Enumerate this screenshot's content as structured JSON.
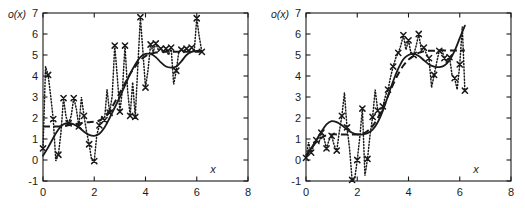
{
  "figure": {
    "panel_count": 2,
    "background": "#ffffff",
    "ink": "#1a1a1a"
  },
  "axes": {
    "ylabel": "o(x)",
    "xlabel": "x",
    "xticks": [
      "0",
      "2",
      "4",
      "6",
      "8"
    ],
    "xtick_values": [
      0,
      2,
      4,
      6,
      8
    ],
    "yticks": [
      "7",
      "6",
      "5",
      "4",
      "3",
      "2",
      "1",
      "0",
      "-1"
    ],
    "ytick_values": [
      7,
      6,
      5,
      4,
      3,
      2,
      1,
      0,
      -1
    ],
    "xlim": [
      0,
      8
    ],
    "ylim": [
      -1,
      7
    ],
    "grid": false,
    "box": true
  },
  "chart_data": [
    {
      "type": "line",
      "title": "",
      "panel": "left",
      "xlabel": "x",
      "ylabel": "o(x)",
      "xlim": [
        0,
        8
      ],
      "ylim": [
        -1,
        7
      ],
      "grid": false,
      "legend_position": "none",
      "series": [
        {
          "name": "noisy-samples",
          "style": "dotted-with-x-markers",
          "marker": "x",
          "x": [
            0.0,
            0.1,
            0.2,
            0.3,
            0.4,
            0.5,
            0.6,
            0.7,
            0.8,
            0.9,
            1.0,
            1.1,
            1.2,
            1.3,
            1.4,
            1.5,
            1.6,
            1.7,
            1.8,
            1.9,
            2.0,
            2.1,
            2.2,
            2.3,
            2.4,
            2.5,
            2.6,
            2.7,
            2.8,
            2.9,
            3.0,
            3.1,
            3.2,
            3.3,
            3.4,
            3.5,
            3.6,
            3.7,
            3.8,
            3.9,
            4.0,
            4.1,
            4.2,
            4.3,
            4.4,
            4.5,
            4.6,
            4.7,
            4.8,
            4.9,
            5.0,
            5.1,
            5.2,
            5.3,
            5.4,
            5.5,
            5.6,
            5.7,
            5.8,
            5.9,
            6.0,
            6.1,
            6.2
          ],
          "y": [
            0.55,
            4.45,
            4.05,
            3.05,
            1.95,
            -0.05,
            0.25,
            1.3,
            2.95,
            2.05,
            1.75,
            2.1,
            2.95,
            2.45,
            1.6,
            3.0,
            2.1,
            1.35,
            0.75,
            0.0,
            -0.05,
            1.2,
            1.65,
            2.1,
            1.9,
            3.35,
            2.25,
            3.05,
            5.45,
            3.95,
            2.3,
            3.35,
            5.45,
            3.35,
            2.1,
            3.7,
            2.05,
            4.45,
            6.8,
            5.15,
            3.45,
            4.3,
            5.5,
            5.15,
            5.55,
            5.25,
            5.3,
            5.1,
            5.3,
            5.0,
            5.35,
            3.6,
            4.25,
            5.15,
            5.25,
            5.2,
            5.3,
            5.2,
            5.35,
            5.15,
            6.75,
            5.85,
            5.15
          ]
        },
        {
          "name": "solid-fit",
          "style": "solid",
          "x": [
            0.0,
            0.2,
            0.4,
            0.6,
            0.8,
            1.0,
            1.2,
            1.4,
            1.6,
            1.8,
            2.0,
            2.2,
            2.4,
            2.6,
            2.8,
            3.0,
            3.2,
            3.4,
            3.6,
            3.8,
            4.0,
            4.2,
            4.4,
            4.6,
            4.8,
            5.0,
            5.2,
            5.4,
            5.6,
            5.8,
            6.0,
            6.2
          ],
          "y": [
            0.2,
            0.6,
            1.05,
            1.45,
            1.7,
            1.75,
            1.7,
            1.55,
            1.35,
            1.2,
            1.15,
            1.25,
            1.55,
            2.0,
            2.5,
            3.0,
            3.55,
            4.1,
            4.55,
            4.9,
            5.05,
            5.05,
            4.9,
            4.65,
            4.45,
            4.4,
            4.45,
            4.7,
            5.0,
            5.15,
            5.2,
            5.2
          ]
        },
        {
          "name": "dashed-fit",
          "style": "dashed",
          "x": [
            0.0,
            0.2,
            0.4,
            0.6,
            0.8,
            1.0,
            1.2,
            1.4,
            1.6,
            1.8,
            2.0,
            2.2,
            2.4,
            2.6,
            2.8,
            3.0,
            3.2,
            3.4,
            3.6,
            3.8,
            4.0,
            4.2,
            4.4,
            4.6,
            4.8,
            5.0,
            5.2,
            5.4,
            5.6,
            5.8,
            6.0,
            6.2
          ],
          "y": [
            1.6,
            1.6,
            1.6,
            1.6,
            1.62,
            1.66,
            1.7,
            1.74,
            1.78,
            1.8,
            1.82,
            1.88,
            2.05,
            2.35,
            2.75,
            3.2,
            3.65,
            4.1,
            4.45,
            4.75,
            4.95,
            5.05,
            5.12,
            5.15,
            5.16,
            5.16,
            5.16,
            5.16,
            5.16,
            5.16,
            5.16,
            5.16
          ]
        }
      ]
    },
    {
      "type": "line",
      "title": "",
      "panel": "right",
      "xlabel": "x",
      "ylabel": "o(x)",
      "xlim": [
        0,
        8
      ],
      "ylim": [
        -1,
        7
      ],
      "grid": false,
      "legend_position": "none",
      "series": [
        {
          "name": "noisy-samples",
          "style": "dotted-with-x-markers",
          "marker": "x",
          "x": [
            0.0,
            0.1,
            0.2,
            0.3,
            0.4,
            0.5,
            0.6,
            0.7,
            0.8,
            0.9,
            1.0,
            1.1,
            1.2,
            1.3,
            1.4,
            1.5,
            1.6,
            1.7,
            1.8,
            1.9,
            2.0,
            2.1,
            2.2,
            2.3,
            2.4,
            2.5,
            2.6,
            2.7,
            2.8,
            2.9,
            3.0,
            3.1,
            3.2,
            3.3,
            3.4,
            3.5,
            3.6,
            3.7,
            3.8,
            3.9,
            4.0,
            4.1,
            4.2,
            4.3,
            4.4,
            4.5,
            4.6,
            4.7,
            4.8,
            4.9,
            5.0,
            5.1,
            5.2,
            5.3,
            5.4,
            5.5,
            5.6,
            5.7,
            5.8,
            5.9,
            6.0,
            6.1,
            6.2
          ],
          "y": [
            0.1,
            0.85,
            0.35,
            0.7,
            0.95,
            0.8,
            1.3,
            1.05,
            0.55,
            0.95,
            1.15,
            0.7,
            0.45,
            1.35,
            2.1,
            3.2,
            1.55,
            0.55,
            -0.95,
            -0.9,
            0.0,
            1.1,
            2.45,
            -0.75,
            0.05,
            1.2,
            2.05,
            3.35,
            2.35,
            2.1,
            2.55,
            3.05,
            3.35,
            3.95,
            4.45,
            4.85,
            5.1,
            5.45,
            5.95,
            5.25,
            5.7,
            5.05,
            5.0,
            5.45,
            6.0,
            5.25,
            5.35,
            5.05,
            4.85,
            3.45,
            4.05,
            4.65,
            5.2,
            5.25,
            4.85,
            4.6,
            4.9,
            4.05,
            3.9,
            3.35,
            4.55,
            6.35,
            3.3
          ]
        },
        {
          "name": "solid-fit",
          "style": "solid",
          "x": [
            0.0,
            0.2,
            0.4,
            0.6,
            0.8,
            1.0,
            1.2,
            1.4,
            1.6,
            1.8,
            2.0,
            2.2,
            2.4,
            2.6,
            2.8,
            3.0,
            3.2,
            3.4,
            3.6,
            3.8,
            4.0,
            4.2,
            4.4,
            4.6,
            4.8,
            5.0,
            5.2,
            5.4,
            5.6,
            5.8,
            6.0,
            6.2
          ],
          "y": [
            0.15,
            0.55,
            0.95,
            1.35,
            1.7,
            1.85,
            1.8,
            1.65,
            1.45,
            1.3,
            1.22,
            1.22,
            1.28,
            1.45,
            1.8,
            2.35,
            3.05,
            3.75,
            4.35,
            4.8,
            5.0,
            5.05,
            4.95,
            4.75,
            4.55,
            4.45,
            4.42,
            4.5,
            4.75,
            5.2,
            5.8,
            6.4
          ]
        },
        {
          "name": "dashed-fit",
          "style": "dashed",
          "x": [
            0.0,
            0.2,
            0.4,
            0.6,
            0.8,
            1.0,
            1.2,
            1.4,
            1.6,
            1.8,
            2.0,
            2.2,
            2.4,
            2.6,
            2.8,
            3.0,
            3.2,
            3.4,
            3.6,
            3.8,
            4.0,
            4.2,
            4.4,
            4.6,
            4.8,
            5.0,
            5.2,
            5.4,
            5.6,
            5.8,
            6.0,
            6.2
          ],
          "y": [
            0.2,
            0.55,
            0.85,
            1.05,
            1.18,
            1.22,
            1.22,
            1.22,
            1.22,
            1.22,
            1.22,
            1.25,
            1.38,
            1.62,
            2.0,
            2.5,
            3.05,
            3.6,
            4.1,
            4.5,
            4.78,
            4.95,
            5.1,
            5.18,
            5.2,
            5.2,
            5.22,
            5.22,
            5.22,
            5.22,
            5.22,
            5.22
          ]
        }
      ]
    }
  ]
}
